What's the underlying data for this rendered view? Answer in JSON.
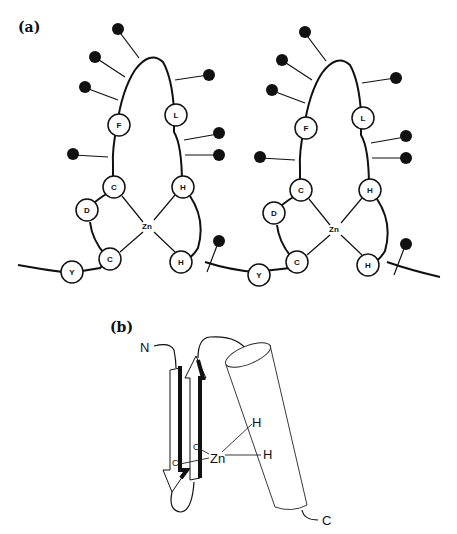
{
  "figure": {
    "panel_a": {
      "label": "(a)",
      "fingers": [
        {
          "residues": [
            "F",
            "L",
            "C",
            "H",
            "D",
            "C",
            "H",
            "Y"
          ],
          "metal": "Zn"
        },
        {
          "residues": [
            "F",
            "L",
            "C",
            "H",
            "D",
            "C",
            "H",
            "Y"
          ],
          "metal": "Zn"
        }
      ]
    },
    "panel_b": {
      "label": "(b)",
      "n_terminus": "N",
      "c_terminus": "C",
      "metal": "Zn",
      "ligands": [
        "C",
        "C",
        "H",
        "H"
      ]
    }
  }
}
